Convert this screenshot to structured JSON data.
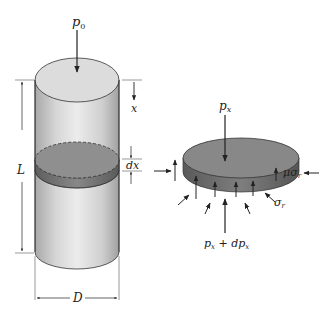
{
  "figure": {
    "colors": {
      "cylinder_light": "#e8e8e8",
      "cylinder_mid": "#c4c4c4",
      "cylinder_dark": "#9a9a9a",
      "slice_top": "#8c8c8c",
      "slice_side": "#6e6e6e",
      "line": "#222222",
      "background": "#ffffff"
    },
    "cylinder": {
      "top_load": {
        "symbol": "p",
        "subscript": "0"
      },
      "position_label": "x",
      "slice_thickness_label": "dx",
      "length_label": "L",
      "diameter_label": "D"
    },
    "element": {
      "top_pressure": {
        "symbol": "p",
        "subscript": "x"
      },
      "bottom_pressure": {
        "text": "p",
        "subscript1": "x",
        "plus": " + dp",
        "subscript2": "x"
      },
      "friction_label": {
        "prefix": "μσ",
        "subscript": "r"
      },
      "radial_stress_label": {
        "symbol": "σ",
        "subscript": "r"
      }
    }
  }
}
